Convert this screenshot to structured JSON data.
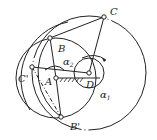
{
  "diagram": {
    "type": "four-bar linkage construction",
    "points": {
      "A": {
        "label": "A",
        "x": 56,
        "y": 78
      },
      "B": {
        "label": "B",
        "x": 50,
        "y": 38
      },
      "C": {
        "label": "C",
        "x": 104,
        "y": 17
      },
      "D": {
        "label": "D",
        "x": 89,
        "y": 73
      },
      "C_prime": {
        "label": "C'",
        "x": 32,
        "y": 67
      },
      "B_prime": {
        "label": "B'",
        "x": 61,
        "y": 117
      }
    },
    "angles": {
      "alpha2": {
        "label": "α",
        "sub": "2"
      },
      "alpha1": {
        "label": "α",
        "sub": "1"
      }
    },
    "colors": {
      "stroke": "#222222",
      "background": "#ffffff"
    }
  }
}
